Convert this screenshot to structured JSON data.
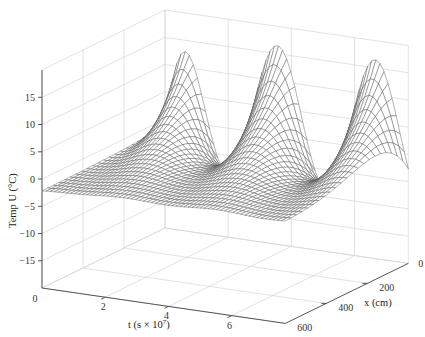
{
  "chart_data": {
    "type": "surface",
    "title": "",
    "xlabel": "t (s × 10^7)",
    "ylabel": "x (cm)",
    "zlabel": "Temp U (°C)",
    "labels": {
      "t_axis": "t (s × 10",
      "t_axis_exp": "7",
      "t_axis_close": ")",
      "x_axis": "x (cm)",
      "z_axis": "Temp U (°C)"
    },
    "t_range": [
      0,
      7.7
    ],
    "x_range": [
      0,
      600
    ],
    "z_range": [
      -20,
      20
    ],
    "t_ticks": [
      {
        "value": 0,
        "label": "0"
      },
      {
        "value": 2,
        "label": "2"
      },
      {
        "value": 4,
        "label": "4"
      },
      {
        "value": 6,
        "label": "6"
      }
    ],
    "x_ticks": [
      {
        "value": 0,
        "label": "0"
      },
      {
        "value": 200,
        "label": "200"
      },
      {
        "value": 400,
        "label": "400"
      },
      {
        "value": 600,
        "label": "600"
      }
    ],
    "z_ticks": [
      {
        "value": 15,
        "label": "15"
      },
      {
        "value": 10,
        "label": "10"
      },
      {
        "value": 5,
        "label": "5"
      },
      {
        "value": 0,
        "label": "0"
      },
      {
        "value": -5,
        "label": "-5"
      },
      {
        "value": -10,
        "label": "-10"
      },
      {
        "value": -15,
        "label": "-15"
      }
    ],
    "surface_model": {
      "description": "Damped periodic temperature wave penetrating from surface x=0 into depth",
      "amplitude": 12.5,
      "mean_offset": 4.0,
      "penetration_depth_cm": 150,
      "period": 3.1,
      "phase_t0": 0.45,
      "transient_decay": 0.35
    },
    "peaks_at_x0": [
      {
        "t": 0.45,
        "U": 17
      },
      {
        "t": 3.5,
        "U": 16
      },
      {
        "t": 6.6,
        "U": 15
      }
    ],
    "troughs_at_x0": [
      {
        "t": 2.0,
        "U": -8
      },
      {
        "t": 5.0,
        "U": -8.5
      }
    ],
    "mesh": {
      "nt": 60,
      "nx": 22
    },
    "grid": true,
    "colors": {
      "mesh_line": "#555555",
      "grid": "#d6d6d6",
      "axis": "#444444",
      "background": "#ffffff"
    }
  }
}
